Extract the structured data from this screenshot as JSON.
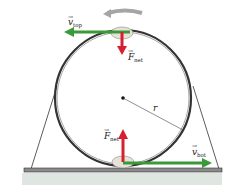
{
  "diagram": {
    "labels": {
      "v_top": {
        "symbol": "v",
        "subscript": "top"
      },
      "F_net_top": {
        "symbol": "F",
        "subscript": "net"
      },
      "radius": "r",
      "F_net_bottom": {
        "symbol": "F",
        "subscript": "net"
      },
      "v_bot": {
        "symbol": "v",
        "subscript": "bot"
      }
    },
    "colors": {
      "velocity_arrow": "#3a9a3a",
      "force_arrow": "#d42030",
      "track": "#333333",
      "motion_arrow": "#9a9a9a",
      "ground": "#c8d2cc"
    }
  }
}
